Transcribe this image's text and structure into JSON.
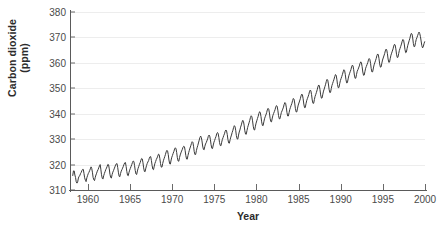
{
  "chart_data": {
    "type": "line",
    "title": "",
    "xlabel": "Year",
    "ylabel": "Carbon dioxide (ppm)",
    "ylabel_line1": "Carbon dioxide",
    "ylabel_line2": "(ppm)",
    "xlim": [
      1958,
      2000
    ],
    "ylim": [
      310,
      380
    ],
    "xticks": [
      1960,
      1965,
      1970,
      1975,
      1980,
      1985,
      1990,
      1995,
      2000
    ],
    "yticks": [
      310,
      320,
      330,
      340,
      350,
      360,
      370,
      380
    ],
    "grid": "horizontal",
    "legend": "none",
    "line_color": "#3b3b3b",
    "grid_color": "#ededed",
    "axis_color": "#5a5a5a",
    "background": "#ffffff",
    "series": [
      {
        "name": "Atmospheric CO2 (Mauna Loa monthly mean)",
        "x": [
          1958.21,
          1958.29,
          1958.38,
          1958.46,
          1958.54,
          1958.62,
          1958.71,
          1958.79,
          1958.88,
          1958.96,
          1959.04,
          1959.12,
          1959.21,
          1959.29,
          1959.38,
          1959.46,
          1959.54,
          1959.62,
          1959.71,
          1959.79,
          1959.88,
          1959.96,
          1960.04,
          1960.12,
          1960.21,
          1960.29,
          1960.38,
          1960.46,
          1960.54,
          1960.62,
          1960.71,
          1960.79,
          1960.88,
          1960.96,
          1961.04,
          1961.12,
          1961.21,
          1961.29,
          1961.38,
          1961.46,
          1961.54,
          1961.62,
          1961.71,
          1961.79,
          1961.88,
          1961.96,
          1962.04,
          1962.12,
          1962.21,
          1962.29,
          1962.38,
          1962.46,
          1962.54,
          1962.62,
          1962.71,
          1962.79,
          1962.88,
          1962.96,
          1963.04,
          1963.12,
          1963.21,
          1963.29,
          1963.38,
          1963.46,
          1963.54,
          1963.62,
          1963.71,
          1963.79,
          1963.88,
          1963.96,
          1964.04,
          1964.12,
          1964.21,
          1964.29,
          1964.38,
          1964.46,
          1964.54,
          1964.62,
          1964.71,
          1964.79,
          1964.88,
          1964.96,
          1965.04,
          1965.12,
          1965.21,
          1965.29,
          1965.38,
          1965.46,
          1965.54,
          1965.62,
          1965.71,
          1965.79,
          1965.88,
          1965.96,
          1966.04,
          1966.12,
          1966.21,
          1966.29,
          1966.38,
          1966.46,
          1966.54,
          1966.62,
          1966.71,
          1966.79,
          1966.88,
          1966.96,
          1967.04,
          1967.12,
          1967.21,
          1967.29,
          1967.38,
          1967.46,
          1967.54,
          1967.62,
          1967.71,
          1967.79,
          1967.88,
          1967.96,
          1968.04,
          1968.12,
          1968.21,
          1968.29,
          1968.38,
          1968.46,
          1968.54,
          1968.62,
          1968.71,
          1968.79,
          1968.88,
          1968.96,
          1969.04,
          1969.12,
          1969.21,
          1969.29,
          1969.38,
          1969.46,
          1969.54,
          1969.62,
          1969.71,
          1969.79,
          1969.88,
          1969.96,
          1970.04,
          1970.12,
          1970.21,
          1970.29,
          1970.38,
          1970.46,
          1970.54,
          1970.62,
          1970.71,
          1970.79,
          1970.88,
          1970.96,
          1971.04,
          1971.12,
          1971.21,
          1971.29,
          1971.38,
          1971.46,
          1971.54,
          1971.62,
          1971.71,
          1971.79,
          1971.88,
          1971.96,
          1972.04,
          1972.12,
          1972.21,
          1972.29,
          1972.38,
          1972.46,
          1972.54,
          1972.62,
          1972.71,
          1972.79,
          1972.88,
          1972.96,
          1973.04,
          1973.12,
          1973.21,
          1973.29,
          1973.38,
          1973.46,
          1973.54,
          1973.62,
          1973.71,
          1973.79,
          1973.88,
          1973.96,
          1974.04,
          1974.12,
          1974.21,
          1974.29,
          1974.38,
          1974.46,
          1974.54,
          1974.62,
          1974.71,
          1974.79,
          1974.88,
          1974.96,
          1975.04,
          1975.12,
          1975.21,
          1975.29,
          1975.38,
          1975.46,
          1975.54,
          1975.62,
          1975.71,
          1975.79,
          1975.88,
          1975.96,
          1976.04,
          1976.12,
          1976.21,
          1976.29,
          1976.38,
          1976.46,
          1976.54,
          1976.62,
          1976.71,
          1976.79,
          1976.88,
          1976.96,
          1977.04,
          1977.12,
          1977.21,
          1977.29,
          1977.38,
          1977.46,
          1977.54,
          1977.62,
          1977.71,
          1977.79,
          1977.88,
          1977.96,
          1978.04,
          1978.12,
          1978.21,
          1978.29,
          1978.38,
          1978.46,
          1978.54,
          1978.62,
          1978.71,
          1978.79,
          1978.88,
          1978.96,
          1979.04,
          1979.12,
          1979.21,
          1979.29,
          1979.38,
          1979.46,
          1979.54,
          1979.62,
          1979.71,
          1979.79,
          1979.88,
          1979.96,
          1980.04,
          1980.12,
          1980.21,
          1980.29,
          1980.38,
          1980.46,
          1980.54,
          1980.62,
          1980.71,
          1980.79,
          1980.88,
          1980.96,
          1981.04,
          1981.12,
          1981.21,
          1981.29,
          1981.38,
          1981.46,
          1981.54,
          1981.62,
          1981.71,
          1981.79,
          1981.88,
          1981.96,
          1982.04,
          1982.12,
          1982.21,
          1982.29,
          1982.38,
          1982.46,
          1982.54,
          1982.62,
          1982.71,
          1982.79,
          1982.88,
          1982.96,
          1983.04,
          1983.12,
          1983.21,
          1983.29,
          1983.38,
          1983.46,
          1983.54,
          1983.62,
          1983.71,
          1983.79,
          1983.88,
          1983.96,
          1984.04,
          1984.12,
          1984.21,
          1984.29,
          1984.38,
          1984.46,
          1984.54,
          1984.62,
          1984.71,
          1984.79,
          1984.88,
          1984.96,
          1985.04,
          1985.12,
          1985.21,
          1985.29,
          1985.38,
          1985.46,
          1985.54,
          1985.62,
          1985.71,
          1985.79,
          1985.88,
          1985.96,
          1986.04,
          1986.12,
          1986.21,
          1986.29,
          1986.38,
          1986.46,
          1986.54,
          1986.62,
          1986.71,
          1986.79,
          1986.88,
          1986.96,
          1987.04,
          1987.12,
          1987.21,
          1987.29,
          1987.38,
          1987.46,
          1987.54,
          1987.62,
          1987.71,
          1987.79,
          1987.88,
          1987.96,
          1988.04,
          1988.12,
          1988.21,
          1988.29,
          1988.38,
          1988.46,
          1988.54,
          1988.62,
          1988.71,
          1988.79,
          1988.88,
          1988.96,
          1989.04,
          1989.12,
          1989.21,
          1989.29,
          1989.38,
          1989.46,
          1989.54,
          1989.62,
          1989.71,
          1989.79,
          1989.88,
          1989.96,
          1990.04,
          1990.12,
          1990.21,
          1990.29,
          1990.38,
          1990.46,
          1990.54,
          1990.62,
          1990.71,
          1990.79,
          1990.88,
          1990.96,
          1991.04,
          1991.12,
          1991.21,
          1991.29,
          1991.38,
          1991.46,
          1991.54,
          1991.62,
          1991.71,
          1991.79,
          1991.88,
          1991.96,
          1992.04,
          1992.12,
          1992.21,
          1992.29,
          1992.38,
          1992.46,
          1992.54,
          1992.62,
          1992.71,
          1992.79,
          1992.88,
          1992.96,
          1993.04,
          1993.12,
          1993.21,
          1993.29,
          1993.38,
          1993.46,
          1993.54,
          1993.62,
          1993.71,
          1993.79,
          1993.88,
          1993.96,
          1994.04,
          1994.12,
          1994.21,
          1994.29,
          1994.38,
          1994.46,
          1994.54,
          1994.62,
          1994.71,
          1994.79,
          1994.88,
          1994.96,
          1995.04,
          1995.12,
          1995.21,
          1995.29,
          1995.38,
          1995.46,
          1995.54,
          1995.62,
          1995.71,
          1995.79,
          1995.88,
          1995.96,
          1996.04,
          1996.12,
          1996.21,
          1996.29,
          1996.38,
          1996.46,
          1996.54,
          1996.62,
          1996.71,
          1996.79,
          1996.88,
          1996.96,
          1997.04,
          1997.12,
          1997.21,
          1997.29,
          1997.38,
          1997.46,
          1997.54,
          1997.62,
          1997.71,
          1997.79,
          1997.88,
          1997.96,
          1998.04,
          1998.12,
          1998.21,
          1998.29,
          1998.38,
          1998.46,
          1998.54,
          1998.62,
          1998.71,
          1998.79,
          1998.88,
          1998.96,
          1999.04,
          1999.12,
          1999.21,
          1999.29,
          1999.38,
          1999.46,
          1999.54,
          1999.62,
          1999.71,
          1999.79,
          1999.88,
          1999.96
        ],
        "y": [
          315.7,
          317.5,
          317.5,
          315.9,
          314.9,
          313.2,
          312.7,
          313.2,
          314.7,
          315.4,
          315.6,
          316.4,
          316.9,
          317.6,
          318.1,
          318.1,
          316.5,
          314.8,
          313.8,
          313.3,
          314.8,
          315.6,
          316.4,
          316.9,
          317.6,
          318.3,
          319.1,
          318.5,
          317.0,
          315.0,
          314.0,
          313.7,
          315.0,
          315.9,
          316.6,
          317.4,
          318.0,
          318.7,
          319.5,
          320.0,
          318.2,
          316.0,
          314.6,
          314.3,
          315.6,
          316.5,
          317.2,
          318.0,
          318.6,
          319.3,
          320.1,
          319.9,
          318.3,
          316.2,
          314.9,
          314.7,
          316.1,
          317.0,
          317.6,
          318.3,
          319.1,
          319.8,
          320.3,
          320.4,
          318.9,
          317.0,
          315.4,
          315.2,
          316.5,
          317.4,
          318.0,
          318.6,
          319.3,
          320.1,
          320.7,
          320.8,
          319.3,
          317.3,
          315.8,
          315.6,
          316.9,
          317.8,
          318.5,
          319.2,
          320.0,
          320.8,
          321.4,
          321.2,
          319.6,
          317.7,
          316.3,
          316.1,
          317.5,
          318.5,
          319.3,
          320.1,
          320.8,
          321.7,
          322.4,
          322.2,
          320.7,
          318.7,
          317.3,
          317.2,
          318.6,
          319.6,
          320.4,
          321.0,
          321.6,
          322.5,
          323.1,
          323.1,
          321.6,
          319.7,
          318.2,
          318.0,
          319.4,
          320.5,
          321.2,
          322.0,
          322.6,
          323.3,
          324.1,
          323.9,
          322.4,
          320.4,
          319.0,
          319.0,
          320.4,
          321.5,
          322.3,
          323.1,
          324.0,
          325.0,
          325.6,
          325.3,
          323.9,
          321.8,
          320.3,
          320.2,
          321.8,
          322.9,
          323.6,
          324.4,
          325.2,
          326.1,
          326.6,
          326.2,
          324.7,
          322.7,
          321.4,
          321.3,
          322.8,
          323.8,
          324.6,
          325.3,
          326.0,
          326.8,
          327.2,
          327.0,
          325.6,
          323.6,
          322.2,
          322.1,
          323.6,
          324.7,
          325.6,
          326.5,
          327.4,
          328.3,
          329.0,
          328.7,
          327.2,
          325.1,
          323.9,
          324.0,
          325.5,
          326.6,
          327.5,
          328.5,
          329.6,
          330.6,
          331.2,
          330.7,
          329.3,
          327.3,
          326.0,
          325.8,
          327.2,
          328.1,
          328.6,
          329.3,
          330.1,
          331.1,
          331.6,
          331.2,
          329.8,
          327.8,
          326.4,
          326.3,
          327.7,
          328.8,
          329.5,
          330.3,
          331.1,
          332.1,
          332.6,
          332.2,
          330.7,
          328.7,
          327.5,
          327.4,
          328.8,
          329.9,
          330.6,
          331.4,
          332.1,
          333.1,
          333.6,
          333.2,
          331.8,
          329.8,
          328.5,
          328.4,
          329.8,
          330.8,
          331.6,
          332.6,
          333.5,
          334.6,
          335.3,
          334.9,
          333.5,
          331.4,
          330.1,
          330.0,
          331.6,
          332.8,
          333.6,
          334.7,
          335.6,
          336.7,
          337.4,
          337.0,
          335.5,
          333.3,
          332.0,
          331.9,
          333.4,
          334.6,
          335.5,
          336.4,
          337.4,
          338.5,
          339.2,
          338.8,
          337.2,
          335.1,
          333.7,
          333.6,
          335.1,
          336.3,
          337.2,
          338.1,
          339.0,
          340.1,
          340.8,
          340.4,
          338.9,
          336.8,
          335.4,
          335.3,
          336.8,
          338.0,
          338.8,
          339.5,
          340.4,
          341.5,
          342.1,
          341.8,
          340.3,
          338.2,
          336.9,
          336.8,
          338.3,
          339.4,
          340.1,
          340.8,
          341.6,
          342.6,
          343.2,
          342.9,
          341.4,
          339.3,
          338.0,
          338.0,
          339.4,
          340.5,
          341.1,
          341.8,
          342.6,
          343.7,
          344.4,
          344.1,
          342.6,
          340.5,
          339.1,
          339.1,
          340.5,
          341.7,
          342.5,
          343.3,
          344.1,
          345.2,
          346.0,
          345.7,
          344.2,
          342.1,
          340.7,
          340.7,
          342.2,
          343.4,
          344.2,
          345.0,
          345.9,
          347.0,
          347.7,
          347.4,
          345.9,
          343.8,
          342.4,
          342.4,
          343.9,
          345.1,
          345.9,
          346.6,
          347.5,
          348.6,
          349.3,
          349.0,
          347.5,
          345.4,
          344.1,
          344.1,
          345.6,
          346.8,
          347.6,
          348.4,
          349.4,
          350.5,
          351.3,
          351.0,
          349.5,
          347.4,
          346.1,
          346.2,
          347.7,
          348.9,
          349.7,
          350.6,
          351.6,
          352.7,
          353.5,
          353.2,
          351.7,
          349.6,
          348.3,
          348.4,
          349.9,
          351.1,
          351.9,
          352.7,
          353.6,
          354.6,
          355.4,
          355.1,
          353.6,
          351.5,
          350.2,
          350.3,
          351.8,
          353.0,
          353.8,
          354.6,
          355.5,
          356.5,
          357.3,
          357.0,
          355.5,
          353.4,
          352.1,
          352.2,
          353.7,
          354.9,
          355.7,
          356.5,
          357.3,
          358.4,
          359.1,
          358.8,
          357.3,
          355.2,
          353.9,
          354.0,
          355.5,
          356.7,
          357.3,
          358.0,
          358.8,
          359.8,
          360.4,
          360.0,
          358.5,
          356.4,
          355.1,
          355.2,
          356.7,
          357.9,
          358.6,
          359.3,
          360.1,
          361.1,
          361.7,
          361.3,
          359.8,
          357.7,
          356.4,
          356.5,
          358.0,
          359.2,
          360.0,
          360.8,
          361.7,
          362.8,
          363.5,
          363.2,
          361.7,
          359.6,
          358.3,
          358.4,
          359.9,
          361.1,
          361.9,
          362.7,
          363.6,
          364.7,
          365.4,
          365.1,
          363.6,
          361.5,
          360.2,
          360.3,
          361.8,
          363.0,
          363.8,
          364.6,
          365.5,
          366.6,
          367.3,
          367.0,
          365.5,
          363.4,
          362.1,
          362.2,
          363.7,
          364.9,
          365.7,
          366.5,
          367.4,
          368.5,
          369.2,
          368.9,
          367.4,
          365.3,
          364.0,
          364.2,
          365.7,
          366.9,
          367.8,
          368.7,
          369.7,
          370.9,
          371.6,
          371.3,
          369.8,
          367.6,
          366.3,
          366.5,
          368.0,
          369.2,
          369.9,
          370.7,
          371.5,
          372.1,
          371.5,
          370.3,
          368.6,
          366.8,
          365.9,
          366.3,
          367.5,
          368.3
        ]
      }
    ]
  }
}
